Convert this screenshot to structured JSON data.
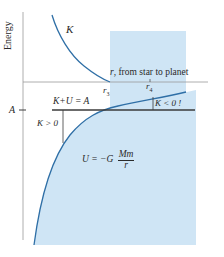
{
  "diagram": {
    "axes": {
      "y_label": "Energy",
      "x_label": "r, from star to planet"
    },
    "curves": {
      "kinetic_label": "K",
      "potential_formula_prefix": "U = −G",
      "potential_formula_numerator": "Mm",
      "potential_formula_denominator": "r"
    },
    "markers": {
      "r3": "r",
      "r3_sub": "3",
      "r4": "r",
      "r4_sub": "4",
      "energy_level": "A"
    },
    "annotations": {
      "total_energy": "K+U = A",
      "k_positive": "K > 0",
      "k_negative": "K < 0 !"
    },
    "colors": {
      "shade": "#cfe5f5",
      "curve": "#2f6fa6",
      "axis": "#9a9a9a",
      "line": "#3a3a3a"
    }
  }
}
